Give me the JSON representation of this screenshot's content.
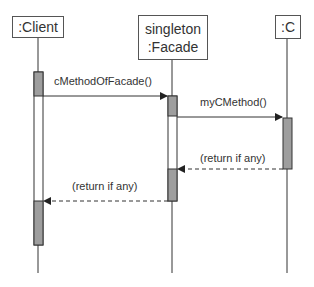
{
  "diagram": {
    "type": "UML sequence diagram",
    "participants": [
      {
        "id": "client",
        "lines": [
          ":Client"
        ]
      },
      {
        "id": "facade",
        "lines": [
          "singleton",
          ":Facade"
        ]
      },
      {
        "id": "c",
        "lines": [
          ":C"
        ]
      }
    ],
    "messages": [
      {
        "from": "client",
        "to": "facade",
        "label": "cMethodOfFacade()",
        "style": "solid"
      },
      {
        "from": "facade",
        "to": "c",
        "label": "myCMethod()",
        "style": "solid"
      },
      {
        "from": "c",
        "to": "facade",
        "label": "(return if any)",
        "style": "dashed"
      },
      {
        "from": "facade",
        "to": "client",
        "label": "(return if any)",
        "style": "dashed"
      }
    ],
    "colors": {
      "activation_active": "#9e9e9e",
      "activation_idle": "#ffffff",
      "line": "#333333"
    }
  }
}
